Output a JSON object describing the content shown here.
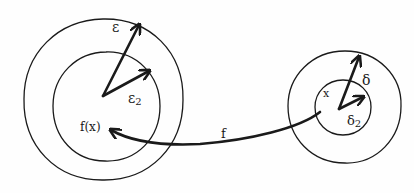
{
  "diagram": {
    "stroke_color": "#1a1a1a",
    "background": "#fefefe",
    "left_group": {
      "outer_circle": {
        "cx": 103,
        "cy": 99,
        "r": 80
      },
      "inner_circle": {
        "cx": 106,
        "cy": 106,
        "r": 54
      },
      "center_point": {
        "x": 103,
        "y": 96
      },
      "epsilon_arrow_tip": {
        "x": 139,
        "y": 24
      },
      "epsilon2_arrow_tip": {
        "x": 150,
        "y": 70
      },
      "labels": {
        "epsilon": "ε",
        "epsilon2_base": "ε",
        "epsilon2_sub": "2",
        "fx": "f(x)"
      }
    },
    "right_group": {
      "outer_circle": {
        "cx": 345,
        "cy": 106,
        "r": 57
      },
      "inner_circle": {
        "cx": 343,
        "cy": 107,
        "r": 28
      },
      "center_point": {
        "x": 339,
        "y": 109
      },
      "delta_arrow_tip": {
        "x": 360,
        "y": 56
      },
      "delta2_arrow_tip": {
        "x": 364,
        "y": 96
      },
      "labels": {
        "delta": "δ",
        "delta2_base": "δ",
        "delta2_sub": "2",
        "x": "x"
      }
    },
    "mapping_arrow": {
      "label": "f",
      "from": {
        "x": 320,
        "y": 112
      },
      "to": {
        "x": 110,
        "y": 130
      }
    }
  }
}
